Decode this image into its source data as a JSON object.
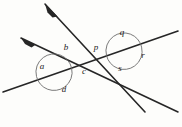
{
  "figure": {
    "background_color": "#fdfdfb",
    "stroke_color": "#262626",
    "arc_color": "#5a5a5a",
    "label_color": "#1a1a1a",
    "width": 182,
    "height": 127
  },
  "lines": [
    {
      "name": "upper-parallel-line",
      "kind": "parallel",
      "x1": 45,
      "y1": 4,
      "x2": 145,
      "y2": 112,
      "arrowhead_at": "start"
    },
    {
      "name": "lower-parallel-line",
      "kind": "parallel",
      "x1": 21,
      "y1": 38,
      "x2": 178,
      "y2": 112,
      "arrowhead_at": "start"
    },
    {
      "name": "transversal-line",
      "kind": "transversal",
      "x1": 3,
      "y1": 92,
      "x2": 178,
      "y2": 31,
      "arrowhead_at": "none"
    }
  ],
  "intersections": [
    {
      "name": "left-intersection",
      "x": 54,
      "y": 72,
      "arc_radius": 18,
      "labels": [
        "a",
        "b",
        "c",
        "d"
      ]
    },
    {
      "name": "right-intersection",
      "x": 124,
      "y": 51,
      "arc_radius": 18,
      "labels": [
        "p",
        "q",
        "r",
        "s"
      ]
    }
  ],
  "angle_labels": [
    {
      "id": "a",
      "text": "a",
      "x": 42,
      "y": 66,
      "intersection": "left-intersection",
      "position": "left"
    },
    {
      "id": "b",
      "text": "b",
      "x": 66,
      "y": 47,
      "intersection": "left-intersection",
      "position": "top"
    },
    {
      "id": "c",
      "text": "c",
      "x": 84,
      "y": 71,
      "intersection": "left-intersection",
      "position": "right"
    },
    {
      "id": "d",
      "text": "d",
      "x": 64,
      "y": 89,
      "intersection": "left-intersection",
      "position": "bottom"
    },
    {
      "id": "p",
      "text": "p",
      "x": 96,
      "y": 47,
      "intersection": "right-intersection",
      "position": "left"
    },
    {
      "id": "q",
      "text": "q",
      "x": 122,
      "y": 32,
      "intersection": "right-intersection",
      "position": "top"
    },
    {
      "id": "r",
      "text": "r",
      "x": 143,
      "y": 55,
      "intersection": "right-intersection",
      "position": "right"
    },
    {
      "id": "s",
      "text": "s",
      "x": 120,
      "y": 68,
      "intersection": "right-intersection",
      "position": "bottom"
    }
  ]
}
